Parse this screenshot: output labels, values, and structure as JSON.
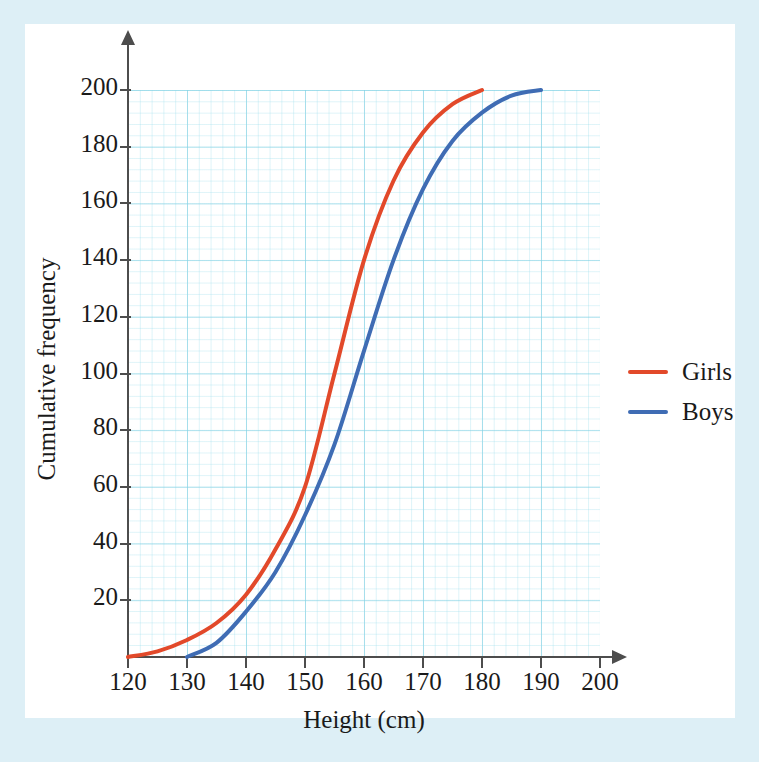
{
  "page": {
    "top_caption": "",
    "background_color": "#ddeff6",
    "panel_color": "#ffffff"
  },
  "chart_data": {
    "type": "line",
    "title": "",
    "xlabel": "Height (cm)",
    "ylabel": "Cumulative frequency",
    "xlim": [
      120,
      200
    ],
    "ylim": [
      0,
      200
    ],
    "xticks": [
      120,
      130,
      140,
      150,
      160,
      170,
      180,
      190,
      200
    ],
    "yticks": [
      20,
      40,
      60,
      80,
      100,
      120,
      140,
      160,
      180,
      200
    ],
    "grid": true,
    "grid_color": "#78cde1",
    "legend_position": "right",
    "series": [
      {
        "name": "Girls",
        "color": "#e2492a",
        "x": [
          120,
          125,
          130,
          135,
          140,
          145,
          150,
          155,
          160,
          165,
          170,
          175,
          180
        ],
        "values": [
          0,
          2,
          6,
          12,
          22,
          38,
          60,
          100,
          140,
          168,
          185,
          195,
          200
        ]
      },
      {
        "name": "Boys",
        "color": "#3f6cb4",
        "x": [
          130,
          135,
          140,
          145,
          150,
          155,
          160,
          165,
          170,
          175,
          180,
          185,
          190
        ],
        "values": [
          0,
          5,
          16,
          30,
          50,
          75,
          108,
          140,
          165,
          182,
          192,
          198,
          200
        ]
      }
    ]
  },
  "legend": {
    "items": [
      {
        "label": "Girls",
        "color": "#e2492a"
      },
      {
        "label": "Boys",
        "color": "#3f6cb4"
      }
    ]
  }
}
